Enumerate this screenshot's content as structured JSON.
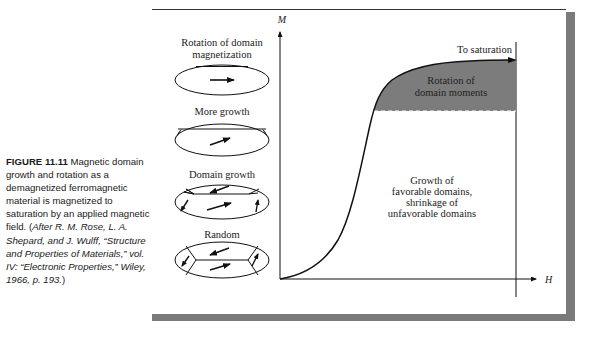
{
  "caption": {
    "figure_label": "FIGURE 11.11",
    "text": " Magnetic domain growth and rotation as a demagnetized ferromagnetic material is magnetized to saturation by an applied magnetic field. (",
    "credit": "After R. M. Rose, L. A. Shepard, and J. Wulff, “Structure and Properties of Materials,” vol. IV: “Electronic Properties,” Wiley, 1966, p. 193.",
    "close": ")"
  },
  "diagram": {
    "stages": [
      {
        "title_lines": [
          "Rotation of domain",
          "magnetization"
        ]
      },
      {
        "title_lines": [
          "More growth"
        ]
      },
      {
        "title_lines": [
          "Domain growth"
        ]
      },
      {
        "title_lines": [
          "Random"
        ]
      }
    ],
    "axes": {
      "y_label": "M",
      "x_label": "H"
    },
    "annotations": {
      "saturation": "To saturation",
      "rotation_region": [
        "Rotation of",
        "domain moments"
      ],
      "growth_region": [
        "Growth of",
        "favorable domains,",
        "shrinkage of",
        "unfavorable domains"
      ]
    },
    "colors": {
      "shaded_region": "#7c7c7c",
      "frame_shadow": "#7a7a7a",
      "line": "#111111"
    }
  }
}
